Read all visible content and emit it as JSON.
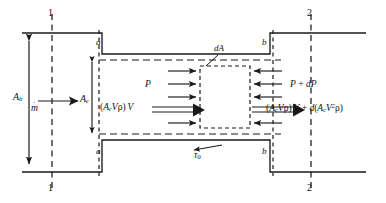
{
  "figure": {
    "kind": "control-volume-diagram",
    "line_color": "#1a1a1a",
    "dash_color": "#1a1a1a",
    "background": "#ffffff"
  },
  "stations": {
    "top_left": "1",
    "bottom_left": "1",
    "top_right": "2",
    "bottom_right": "2"
  },
  "sections": {
    "upper_left": "a",
    "lower_left": "a",
    "upper_right": "b",
    "lower_right": "b"
  },
  "areas": {
    "bulk": {
      "symbol": "A",
      "subscript": "b"
    },
    "cross": {
      "symbol": "A",
      "subscript": "c"
    },
    "element": {
      "d": "d",
      "symbol": "A"
    }
  },
  "massflow": {
    "symbol": "m",
    "accent": "˙"
  },
  "pressure": {
    "inlet": "P",
    "outlet_lead": "P",
    "outlet_plus": "+",
    "outlet_diff_d": "d",
    "outlet_diff_P": "P"
  },
  "momentum": {
    "inlet": {
      "open": "(",
      "A": "A",
      "A_sub": "c",
      "V": "V",
      "rho": "ρ",
      "close": ")",
      "V_out": "V"
    },
    "outlet": {
      "open": "(",
      "A": "A",
      "A_sub": "c",
      "V": "V",
      "rho": "ρ",
      "close": ")",
      "V_out": "V",
      "plus": "+",
      "d": "d",
      "d_open": "(",
      "d_A": "A",
      "d_A_sub": "c",
      "d_V": "V",
      "d_V_sup": "2",
      "d_rho": "ρ",
      "d_close": ")"
    }
  },
  "shear": {
    "symbol": "τ",
    "subscript": "0"
  }
}
